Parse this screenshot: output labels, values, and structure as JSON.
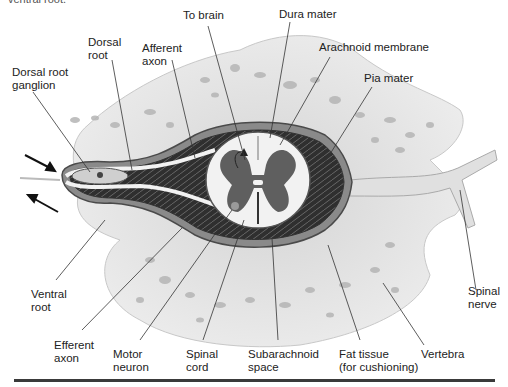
{
  "caption_fragment": "ventral root.",
  "figure": {
    "labels": {
      "dorsal_root_ganglion": "Dorsal root\nganglion",
      "dorsal_root": "Dorsal\nroot",
      "afferent_axon": "Afferent\naxon",
      "to_brain": "To brain",
      "dura_mater": "Dura mater",
      "arachnoid_membrane": "Arachnoid membrane",
      "pia_mater": "Pia mater",
      "ventral_root": "Ventral\nroot",
      "efferent_axon": "Efferent\naxon",
      "motor_neuron": "Motor\nneuron",
      "spinal_cord": "Spinal\ncord",
      "subarachnoid_space": "Subarachnoid\nspace",
      "fat_tissue": "Fat tissue\n(for cushioning)",
      "vertebra": "Vertebra",
      "spinal_nerve": "Spinal\nnerve"
    },
    "colors": {
      "bone": "#e6e6e6",
      "bone_spots": "#b9b9b9",
      "membrane_dark": "#3d3d3d",
      "membrane_mid": "#8a8a8a",
      "white_matter": "#f2f2f2",
      "gray_matter": "#5f5f5f",
      "leader_line": "#333333"
    }
  }
}
